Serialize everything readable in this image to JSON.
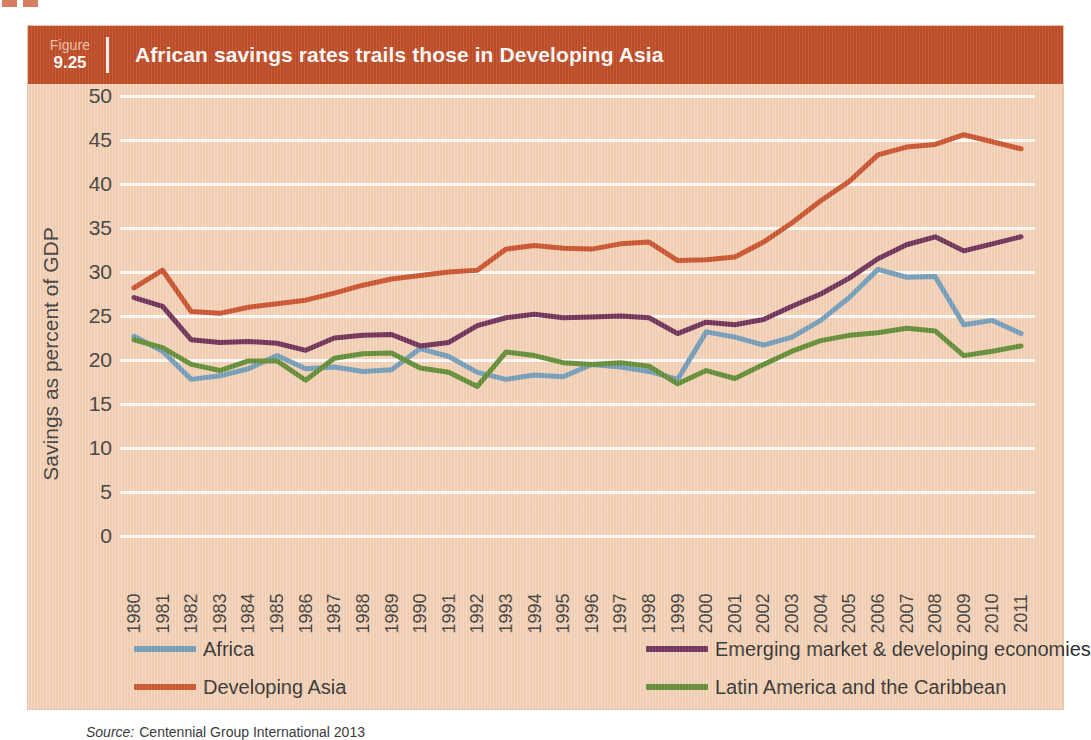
{
  "figure": {
    "label": "Figure",
    "number": "9.25",
    "title": "African savings rates trails those in Developing Asia"
  },
  "source": {
    "prefix": "Source:",
    "text": "Centennial Group International 2013"
  },
  "colors": {
    "header_bg": "#c4502a",
    "panel_bg": "#f3d2b8",
    "gridline": "#ffffff",
    "africa": "#6f9cbb",
    "developing_asia": "#c8502b",
    "emerging_market": "#6b2c57",
    "latin_america": "#5d8c33"
  },
  "chart_data": {
    "type": "line",
    "title": "African savings rates trails those in Developing Asia",
    "xlabel": "",
    "ylabel": "Savings as percent of GDP",
    "ylim": [
      0,
      50
    ],
    "yticks": [
      0,
      5,
      10,
      15,
      20,
      25,
      30,
      35,
      40,
      45,
      50
    ],
    "grid": true,
    "legend_position": "bottom",
    "categories": [
      "1980",
      "1981",
      "1982",
      "1983",
      "1984",
      "1985",
      "1986",
      "1987",
      "1988",
      "1989",
      "1990",
      "1991",
      "1992",
      "1993",
      "1994",
      "1995",
      "1996",
      "1997",
      "1998",
      "1999",
      "2000",
      "2001",
      "2002",
      "2003",
      "2004",
      "2005",
      "2006",
      "2007",
      "2008",
      "2009",
      "2010",
      "2011"
    ],
    "series": [
      {
        "name": "Africa",
        "color": "#6f9cbb",
        "values": [
          22.7,
          21.0,
          17.8,
          18.2,
          19.0,
          20.5,
          19.0,
          19.2,
          18.7,
          18.9,
          21.3,
          20.4,
          18.6,
          17.8,
          18.3,
          18.1,
          19.5,
          19.2,
          18.7,
          17.8,
          23.2,
          22.6,
          21.7,
          22.6,
          24.5,
          27.1,
          30.3,
          29.4,
          29.5,
          24.0,
          24.5,
          23.0
        ]
      },
      {
        "name": "Developing Asia",
        "color": "#c8502b",
        "values": [
          28.2,
          30.2,
          25.5,
          25.3,
          26.0,
          26.4,
          26.8,
          27.6,
          28.5,
          29.2,
          29.6,
          30.0,
          30.2,
          32.6,
          33.0,
          32.7,
          32.6,
          33.2,
          33.4,
          31.3,
          31.4,
          31.7,
          33.4,
          35.6,
          38.1,
          40.3,
          43.3,
          44.2,
          44.5,
          45.6,
          44.8,
          44.0
        ]
      },
      {
        "name": "Emerging market & developing economies",
        "color": "#6b2c57",
        "values": [
          27.1,
          26.1,
          22.3,
          22.0,
          22.1,
          21.9,
          21.1,
          22.5,
          22.8,
          22.9,
          21.6,
          22.0,
          23.9,
          24.8,
          25.2,
          24.8,
          24.9,
          25.0,
          24.8,
          23.0,
          24.3,
          24.0,
          24.6,
          26.1,
          27.5,
          29.3,
          31.5,
          33.1,
          34.0,
          32.4,
          33.2,
          34.0
        ]
      },
      {
        "name": "Latin America and the Caribbean",
        "color": "#5d8c33",
        "values": [
          22.3,
          21.4,
          19.5,
          18.8,
          19.9,
          19.9,
          17.7,
          20.2,
          20.7,
          20.8,
          19.1,
          18.6,
          17.0,
          20.9,
          20.5,
          19.7,
          19.5,
          19.7,
          19.3,
          17.3,
          18.8,
          17.9,
          19.5,
          21.0,
          22.2,
          22.8,
          23.1,
          23.6,
          23.3,
          20.5,
          21.0,
          21.6
        ]
      }
    ]
  },
  "legend": {
    "left": [
      {
        "label": "Africa",
        "color": "#6f9cbb"
      },
      {
        "label": "Developing Asia",
        "color": "#c8502b"
      }
    ],
    "right": [
      {
        "label": "Emerging market & developing economies",
        "color": "#6b2c57"
      },
      {
        "label": "Latin America and the Caribbean",
        "color": "#5d8c33"
      }
    ]
  }
}
